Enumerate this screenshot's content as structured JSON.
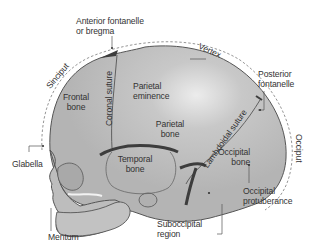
{
  "figure": {
    "colors": {
      "bone_fill": "#b9b9b9",
      "bone_highlight": "#e8e8e8",
      "suture_dark": "#3d3d3d",
      "outline": "#555555",
      "dashed_arc": "#8a8a8a",
      "text": "#333333",
      "background": "#ffffff"
    }
  },
  "labels": {
    "anterior_fontanelle_line1": "Anterior fontanelle",
    "anterior_fontanelle_line2": "or bregma",
    "sinciput": "Sinciput",
    "vertex": "Vertex",
    "posterior_fontanelle_line1": "Posterior",
    "posterior_fontanelle_line2": "fontanelle",
    "occiput": "Occiput",
    "frontal_bone_line1": "Frontal",
    "frontal_bone_line2": "bone",
    "coronal_suture": "Coronal suture",
    "parietal_eminence_line1": "Parietal",
    "parietal_eminence_line2": "eminence",
    "parietal_bone_line1": "Parietal",
    "parietal_bone_line2": "bone",
    "lambdoidal_suture": "Lambdoidal suture",
    "occipital_bone_line1": "Occipital",
    "occipital_bone_line2": "bone",
    "temporal_bone_line1": "Temporal",
    "temporal_bone_line2": "bone",
    "glabella": "Glabella",
    "mentum": "Mentum",
    "occipital_protuberance_line1": "Occipital",
    "occipital_protuberance_line2": "protuberance",
    "suboccipital_line1": "Suboccipital",
    "suboccipital_line2": "region"
  }
}
